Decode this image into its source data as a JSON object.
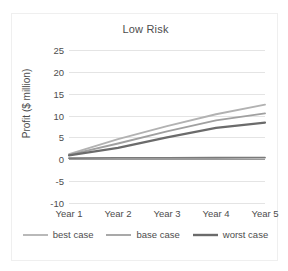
{
  "chart_data": {
    "type": "line",
    "title": "Low Risk",
    "xlabel": "",
    "ylabel": "Profit ($ million)",
    "categories": [
      "Year 1",
      "Year 2",
      "Year 3",
      "Year 4",
      "Year 5"
    ],
    "ylim": [
      -10,
      25
    ],
    "ytick_labels": [
      "25",
      "20",
      "15",
      "10",
      "5",
      "0",
      "-5",
      "-10"
    ],
    "ytick_values": [
      25,
      20,
      15,
      10,
      5,
      0,
      -5,
      -10
    ],
    "grid": true,
    "legend_position": "bottom",
    "series": [
      {
        "name": "best case",
        "color": "#b2b2b2",
        "width": 1.9,
        "values": [
          1.2,
          4.6,
          7.6,
          10.3,
          12.5
        ]
      },
      {
        "name": "base case",
        "color": "#a0a0a0",
        "width": 1.9,
        "values": [
          1.0,
          3.6,
          6.4,
          8.9,
          10.5
        ]
      },
      {
        "name": "worst case",
        "color": "#6b6b6b",
        "width": 2.2,
        "values": [
          0.9,
          2.6,
          5.0,
          7.2,
          8.4
        ]
      },
      {
        "name": "baseline",
        "color": "#7a7a7a",
        "width": 1.8,
        "values": [
          0.25,
          0.3,
          0.3,
          0.35,
          0.4
        ],
        "in_legend": false
      }
    ],
    "legend": [
      {
        "label": "best case",
        "color": "#b2b2b2",
        "width": 1.8
      },
      {
        "label": "base case",
        "color": "#a0a0a0",
        "width": 1.8
      },
      {
        "label": "worst case",
        "color": "#6b6b6b",
        "width": 2.4
      }
    ]
  }
}
